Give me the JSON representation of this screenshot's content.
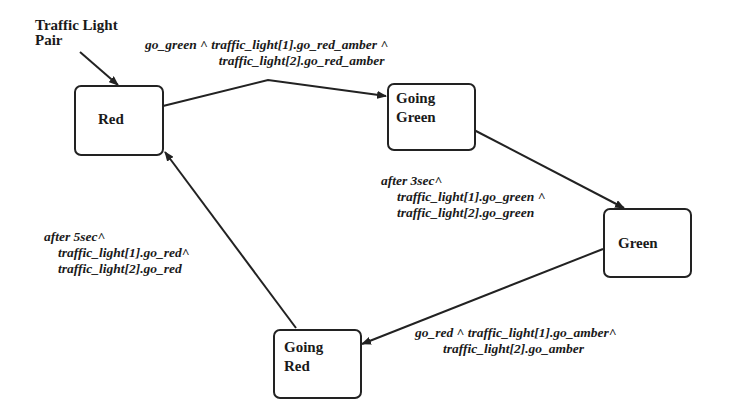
{
  "diagram": {
    "type": "state-machine",
    "initial_label": {
      "line1": "Traffic Light",
      "line2": "Pair"
    },
    "states": [
      {
        "id": "red",
        "line1": "Red",
        "line2": ""
      },
      {
        "id": "going_green",
        "line1": "Going",
        "line2": "Green"
      },
      {
        "id": "green",
        "line1": "Green",
        "line2": ""
      },
      {
        "id": "going_red",
        "line1": "Going",
        "line2": "Red"
      }
    ],
    "transitions": [
      {
        "from": "red",
        "to": "going_green",
        "line1": "go_green ^ traffic_light[1].go_red_amber ^",
        "line2": "traffic_light[2].go_red_amber",
        "line3": ""
      },
      {
        "from": "going_green",
        "to": "green",
        "line1": "after 3sec^",
        "line2": "traffic_light[1].go_green ^",
        "line3": "traffic_light[2].go_green"
      },
      {
        "from": "green",
        "to": "going_red",
        "line1": "go_red ^ traffic_light[1].go_amber^",
        "line2": "traffic_light[2].go_amber",
        "line3": ""
      },
      {
        "from": "going_red",
        "to": "red",
        "line1": "after 5sec^",
        "line2": "traffic_light[1].go_red^",
        "line3": "traffic_light[2].go_red"
      }
    ]
  }
}
